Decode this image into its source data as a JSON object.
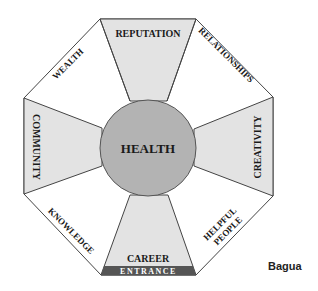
{
  "diagram": {
    "caption": "Bagua",
    "center": {
      "label": "HEALTH"
    },
    "entrance_label": "ENTRANCE",
    "areas": [
      {
        "position": "top",
        "label": "REPUTATION",
        "shaded": true
      },
      {
        "position": "top-right",
        "label": "RELATIONSHIPS",
        "shaded": false
      },
      {
        "position": "right",
        "label": "CREATIVITY",
        "shaded": true
      },
      {
        "position": "bottom-right",
        "label_line1": "HELPFUL",
        "label_line2": "PEOPLE",
        "shaded": false
      },
      {
        "position": "bottom",
        "label": "CAREER",
        "shaded": true
      },
      {
        "position": "bottom-left",
        "label": "KNOWLEDGE",
        "shaded": false
      },
      {
        "position": "left",
        "label": "COMMUNITY",
        "shaded": true
      },
      {
        "position": "top-left",
        "label": "WEALTH",
        "shaded": false
      }
    ],
    "colors": {
      "shaded": "#e3e3e3",
      "unshaded": "#ffffff",
      "center": "#b3b3b3",
      "entrance": "#555555",
      "stroke": "#444444"
    }
  }
}
